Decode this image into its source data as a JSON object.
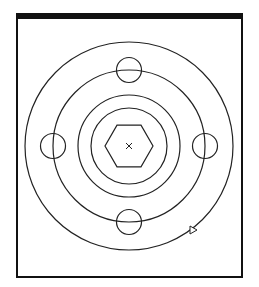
{
  "diagram": {
    "type": "concentric-rings-drawing",
    "frame": {
      "x": 17,
      "y": 13,
      "width": 225,
      "height": 264,
      "top_bar_thickness": 6,
      "border_thickness": 2
    },
    "center": {
      "x": 129,
      "y": 146,
      "marker": "x"
    },
    "rings": [
      {
        "name": "outer-ring",
        "r": 104
      },
      {
        "name": "bolt-circle-ring",
        "r": 76
      },
      {
        "name": "middle-ring",
        "r": 51
      },
      {
        "name": "inner-ring",
        "r": 38
      }
    ],
    "hexagon": {
      "r": 24,
      "orientation": "flat-top"
    },
    "small_circles": {
      "r": 12.5,
      "on_ring_radius": 76,
      "positions": [
        "top",
        "right",
        "bottom",
        "left"
      ]
    },
    "direction_marker": {
      "shape": "triangle",
      "x": 193,
      "y": 230,
      "pointing": "right"
    },
    "colors": {
      "stroke": "#222222",
      "frame": "#111111",
      "background": "#ffffff"
    }
  }
}
